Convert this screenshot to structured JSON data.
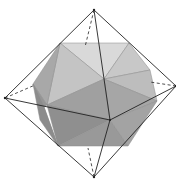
{
  "figure": {
    "width": 176,
    "height": 191,
    "colors": {
      "background": "#ffffff",
      "edge": "#222222",
      "face_lightest": "#d9d9d9",
      "face_light": "#c4c4c4",
      "face_mid": "#adadad",
      "face_dark": "#959595",
      "face_darker": "#858585"
    },
    "octahedron": {
      "vertices": {
        "top": [
          94,
          10
        ],
        "bottom": [
          94,
          177
        ],
        "left": [
          5,
          98
        ],
        "right": [
          176,
          86
        ],
        "front": [
          110,
          120
        ],
        "back": [
          85,
          47
        ]
      }
    },
    "icosahedron": {
      "vertices": {
        "top_left": [
          60,
          43
        ],
        "top_right": [
          129,
          43
        ],
        "right_upper": [
          150,
          70
        ],
        "right": [
          157,
          101
        ],
        "bottom_right": [
          128,
          146
        ],
        "bottom_left": [
          58,
          146
        ],
        "left": [
          44,
          107
        ],
        "left_upper": [
          33,
          84
        ],
        "center": [
          104,
          79
        ],
        "center_low": [
          110,
          120
        ]
      }
    }
  }
}
